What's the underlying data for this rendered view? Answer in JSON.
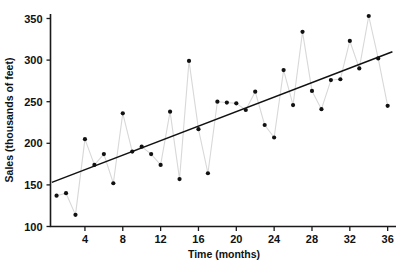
{
  "chart_data": {
    "type": "scatter",
    "title": "",
    "xlabel": "Time (months)",
    "ylabel": "Sales (thousands of feet)",
    "xlim": [
      0,
      37
    ],
    "ylim": [
      100,
      360
    ],
    "xticks": [
      4,
      8,
      12,
      16,
      20,
      24,
      28,
      32,
      36
    ],
    "yticks": [
      100,
      150,
      200,
      250,
      300,
      350
    ],
    "grid": false,
    "legend": "none",
    "x": [
      1,
      2,
      3,
      4,
      5,
      6,
      7,
      8,
      9,
      10,
      11,
      12,
      13,
      14,
      15,
      16,
      17,
      18,
      19,
      20,
      21,
      22,
      23,
      24,
      25,
      26,
      27,
      28,
      29,
      30,
      31,
      32,
      33,
      34,
      35,
      36
    ],
    "values": [
      137,
      140,
      114,
      205,
      174,
      187,
      152,
      236,
      190,
      196,
      187,
      174,
      238,
      157,
      299,
      217,
      164,
      250,
      249,
      248,
      240,
      262,
      222,
      207,
      288,
      246,
      334,
      263,
      241,
      276,
      277,
      323,
      290,
      353,
      302,
      245
    ],
    "series": [
      {
        "name": "Sales",
        "values": [
          137,
          140,
          114,
          205,
          174,
          187,
          152,
          236,
          190,
          196,
          187,
          174,
          238,
          157,
          299,
          217,
          164,
          250,
          249,
          248,
          240,
          262,
          222,
          207,
          288,
          246,
          334,
          263,
          241,
          276,
          277,
          323,
          290,
          353,
          302,
          245
        ]
      }
    ],
    "trendline": {
      "name": "Linear trend",
      "x_start": 0.5,
      "y_start": 153,
      "x_end": 36.5,
      "y_end": 310
    },
    "colors": {
      "point": "#111111",
      "connector": "#d8d8d8",
      "trend": "#111111",
      "axis": "#1a1a1a",
      "background": "#ffffff"
    }
  },
  "axes": {
    "y_tick_labels": [
      "350",
      "300",
      "250",
      "200",
      "150",
      "100"
    ],
    "x_tick_labels": [
      "4",
      "8",
      "12",
      "16",
      "20",
      "24",
      "28",
      "32",
      "36"
    ],
    "x_title": "Time (months)",
    "y_title": "Sales (thousands of feet)"
  }
}
